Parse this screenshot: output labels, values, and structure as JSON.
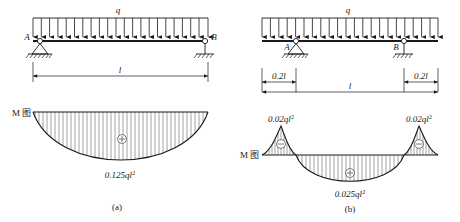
{
  "figure": {
    "panels": [
      {
        "id": "a",
        "caption": "(a)",
        "beam_type": "simply-supported",
        "load_label": "q",
        "span_label": "l",
        "support_left_label": "A",
        "support_right_label": "B",
        "support_left_type": "pin",
        "support_right_type": "roller",
        "moment_diagram_label": "M 图",
        "sign_marks": [
          "+"
        ],
        "moment_values": [
          {
            "text": "0.125ql",
            "exponent": "2",
            "position": "midspan",
            "sign": "+"
          }
        ],
        "load_arrow_count": 22
      },
      {
        "id": "b",
        "caption": "(b)",
        "beam_type": "overhanging",
        "load_label": "q",
        "span_label": "l",
        "support_left_label": "A",
        "support_right_label": "B",
        "support_left_type": "pin",
        "support_right_type": "roller",
        "overhang_left_label": "0.2l",
        "overhang_right_label": "0.2l",
        "moment_diagram_label": "M 图",
        "sign_marks": [
          "-",
          "+",
          "-"
        ],
        "moment_values": [
          {
            "text": "0.02ql",
            "exponent": "2",
            "position": "left-support",
            "sign": "-"
          },
          {
            "text": "0.02ql",
            "exponent": "2",
            "position": "right-support",
            "sign": "-"
          },
          {
            "text": "0.025ql",
            "exponent": "2",
            "position": "midspan",
            "sign": "+"
          }
        ],
        "load_arrow_count": 22
      }
    ],
    "colors": {
      "line": "#1a1a1a",
      "hatch": "#555555",
      "background": "#ffffff"
    }
  }
}
